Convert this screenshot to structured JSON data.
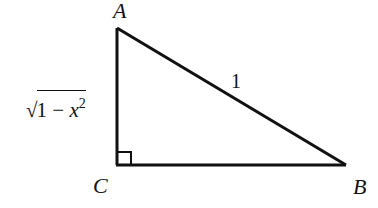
{
  "diagram": {
    "type": "right-triangle",
    "vertices": [
      {
        "id": "A",
        "label": "A"
      },
      {
        "id": "B",
        "label": "B"
      },
      {
        "id": "C",
        "label": "C"
      }
    ],
    "right_angle_at": "C",
    "sides": {
      "AB": {
        "label": "1"
      },
      "AC": {
        "label_radical_sign": "√",
        "label_radicand_prefix": "1 − ",
        "label_variable": "x",
        "label_exponent": "2",
        "label_text": "√(1 − x²)"
      },
      "BC": {
        "label": ""
      }
    },
    "colors": {
      "stroke": "#111111",
      "background": "#ffffff"
    }
  }
}
